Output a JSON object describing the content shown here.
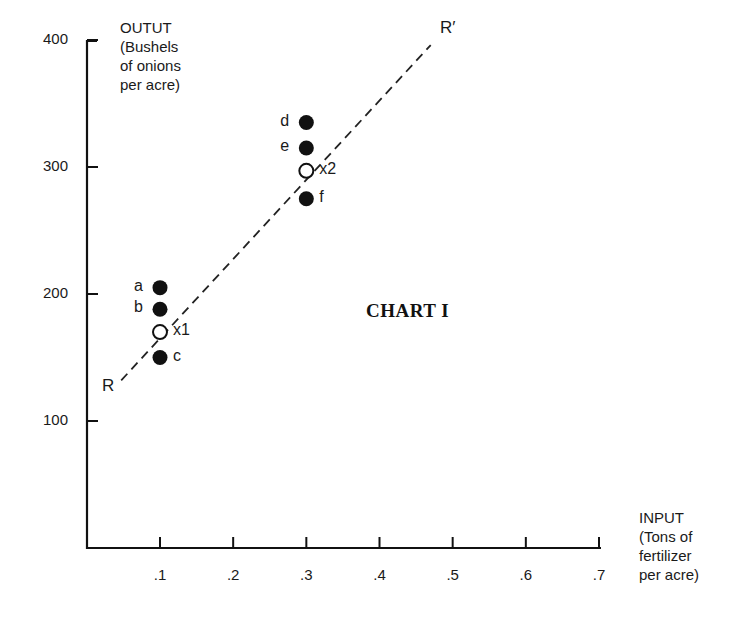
{
  "chart_data": {
    "type": "scatter",
    "title": "CHART I",
    "xlabel": "INPUT (Tons of fertilizer per acre)",
    "ylabel": "OUTUT (Bushels of onions per acre)",
    "xlabel_lines": [
      "INPUT",
      "(Tons of",
      "fertilizer",
      "per acre)"
    ],
    "ylabel_lines": [
      "OUTUT",
      "(Bushels",
      "of onions",
      "per acre)"
    ],
    "x_ticks": [
      ".1",
      ".2",
      ".3",
      ".4",
      ".5",
      ".6",
      ".7"
    ],
    "y_ticks": [
      "100",
      "200",
      "300",
      "400"
    ],
    "xlim": [
      0,
      0.7
    ],
    "ylim": [
      0,
      400
    ],
    "grid": false,
    "series": [
      {
        "name": "observed",
        "marker": "filled-circle",
        "points": [
          {
            "label": "a",
            "x": 0.1,
            "y": 205
          },
          {
            "label": "b",
            "x": 0.1,
            "y": 188
          },
          {
            "label": "c",
            "x": 0.1,
            "y": 150
          },
          {
            "label": "d",
            "x": 0.3,
            "y": 335
          },
          {
            "label": "e",
            "x": 0.3,
            "y": 315
          },
          {
            "label": "f",
            "x": 0.3,
            "y": 275
          }
        ]
      },
      {
        "name": "means",
        "marker": "open-circle",
        "points": [
          {
            "label": "x1",
            "x": 0.1,
            "y": 170
          },
          {
            "label": "x2",
            "x": 0.3,
            "y": 297
          }
        ]
      }
    ],
    "regression_line": {
      "style": "dashed",
      "start_label": "R",
      "end_label": "R′",
      "start": {
        "x": 0.047,
        "y": 132
      },
      "end": {
        "x": 0.47,
        "y": 396
      }
    }
  }
}
